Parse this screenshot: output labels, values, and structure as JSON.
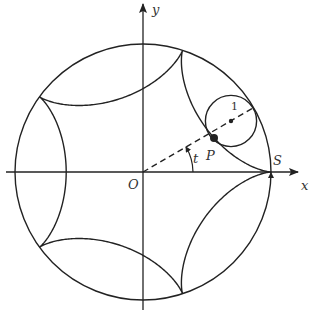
{
  "diagram": {
    "type": "hypocycloid",
    "cusps": 5,
    "outer_circle": {
      "cx": 143,
      "cy": 172,
      "r": 128
    },
    "rolling_circle": {
      "radius_label": "1",
      "angle_deg": 30
    },
    "labels": {
      "x_axis": "x",
      "y_axis": "y",
      "origin": "O",
      "point_p": "P",
      "point_s": "S",
      "angle": "t",
      "radius": "1"
    },
    "colors": {
      "stroke": "#222222",
      "background": "#ffffff"
    }
  }
}
